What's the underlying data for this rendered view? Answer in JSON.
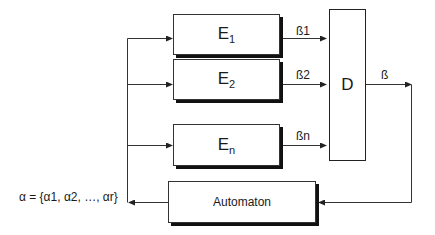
{
  "diagram": {
    "blocks": [
      {
        "id": "E1",
        "label": "E",
        "subscript": "1"
      },
      {
        "id": "E2",
        "label": "E",
        "subscript": "2"
      },
      {
        "id": "En",
        "label": "E",
        "subscript": "n"
      },
      {
        "id": "D",
        "label": "D"
      },
      {
        "id": "automaton",
        "label": "Automaton"
      }
    ],
    "signals": {
      "b1": "ß1",
      "b2": "ß2",
      "bn": "ßn",
      "b": "ß",
      "alpha": "α = {α1, α2, …, αr}"
    },
    "edges": [
      {
        "from": "alpha",
        "to": "E1"
      },
      {
        "from": "alpha",
        "to": "E2"
      },
      {
        "from": "alpha",
        "to": "En"
      },
      {
        "from": "E1",
        "to": "D",
        "label": "ß1"
      },
      {
        "from": "E2",
        "to": "D",
        "label": "ß2"
      },
      {
        "from": "En",
        "to": "D",
        "label": "ßn"
      },
      {
        "from": "D",
        "to": "automaton",
        "label": "ß"
      },
      {
        "from": "automaton",
        "to": "alpha"
      }
    ]
  }
}
